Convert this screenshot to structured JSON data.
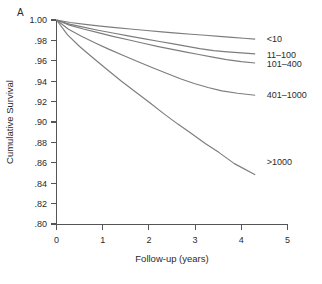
{
  "figure": {
    "panel_label": "A",
    "curve_color": "#7d7d7d",
    "axis_color": "#555555",
    "text_color": "#2b2b2b"
  },
  "labels": {
    "group_1": "<10",
    "group_2": "11–100",
    "group_3": "101–400",
    "group_4": "401–1000",
    "group_5": ">1000"
  },
  "axis": {
    "x_title": "Follow-up (years)",
    "y_title": "Cumulative Survival",
    "x_ticks": [
      "0",
      "1",
      "2",
      "3",
      "4",
      "5"
    ],
    "y_ticks": [
      "1.00",
      ".98",
      ".96",
      ".94",
      ".92",
      ".90",
      ".88",
      ".86",
      ".84",
      ".82",
      ".80"
    ]
  },
  "chart_data": {
    "type": "line",
    "title": "",
    "subtitle": "",
    "xlabel": "Follow-up (years)",
    "ylabel": "Cumulative Survival",
    "xlim": [
      0,
      5
    ],
    "ylim": [
      0.8,
      1.0
    ],
    "xticks": [
      0,
      1,
      2,
      3,
      4,
      5
    ],
    "yticks": [
      1.0,
      0.98,
      0.96,
      0.94,
      0.92,
      0.9,
      0.88,
      0.86,
      0.84,
      0.82,
      0.8
    ],
    "grid": false,
    "legend": "inline-right-of-curve-ends",
    "annotations": [
      "A"
    ],
    "series": [
      {
        "name": "<10",
        "label_x": 4.55,
        "label_y": 0.9815,
        "x": [
          0.0,
          0.3,
          0.62,
          0.95,
          1.28,
          1.6,
          1.95,
          2.28,
          2.6,
          2.92,
          3.22,
          3.52,
          3.8,
          4.05,
          4.3
        ],
        "y": [
          1.0,
          0.9975,
          0.9957,
          0.994,
          0.9925,
          0.9912,
          0.9897,
          0.9884,
          0.9872,
          0.986,
          0.985,
          0.984,
          0.9829,
          0.9821,
          0.9812
        ]
      },
      {
        "name": "11–100",
        "label_x": 4.55,
        "label_y": 0.966,
        "x": [
          0.0,
          0.28,
          0.58,
          0.9,
          1.22,
          1.55,
          1.88,
          2.2,
          2.5,
          2.8,
          3.1,
          3.4,
          3.7,
          4.0,
          4.3
        ],
        "y": [
          1.0,
          0.996,
          0.993,
          0.99,
          0.9872,
          0.9845,
          0.9818,
          0.9792,
          0.9768,
          0.9744,
          0.972,
          0.97,
          0.9688,
          0.9678,
          0.9668
        ]
      },
      {
        "name": "101–400",
        "label_x": 4.55,
        "label_y": 0.957,
        "x": [
          0.0,
          0.28,
          0.58,
          0.9,
          1.22,
          1.55,
          1.88,
          2.18,
          2.48,
          2.78,
          3.08,
          3.38,
          3.68,
          4.0,
          4.3
        ],
        "y": [
          1.0,
          0.995,
          0.9912,
          0.9876,
          0.984,
          0.9806,
          0.9772,
          0.9742,
          0.9714,
          0.9688,
          0.9662,
          0.9636,
          0.9612,
          0.9592,
          0.9578
        ]
      },
      {
        "name": "401–1000",
        "label_x": 4.55,
        "label_y": 0.9265,
        "x": [
          0.0,
          0.26,
          0.54,
          0.84,
          1.14,
          1.46,
          1.78,
          2.08,
          2.38,
          2.68,
          2.98,
          3.28,
          3.58,
          3.92,
          4.3
        ],
        "y": [
          1.0,
          0.991,
          0.984,
          0.9775,
          0.9712,
          0.965,
          0.9588,
          0.9532,
          0.9478,
          0.9424,
          0.9378,
          0.9338,
          0.9305,
          0.9282,
          0.9262
        ]
      },
      {
        "name": ">1000",
        "label_x": 4.55,
        "label_y": 0.861,
        "x": [
          0.0,
          0.24,
          0.5,
          0.8,
          1.1,
          1.4,
          1.72,
          2.02,
          2.32,
          2.62,
          2.92,
          3.22,
          3.52,
          3.85,
          4.3
        ],
        "y": [
          1.0,
          0.9855,
          0.974,
          0.9625,
          0.9512,
          0.9402,
          0.9292,
          0.9188,
          0.9082,
          0.8982,
          0.8888,
          0.879,
          0.87,
          0.8592,
          0.8482
        ]
      }
    ]
  }
}
